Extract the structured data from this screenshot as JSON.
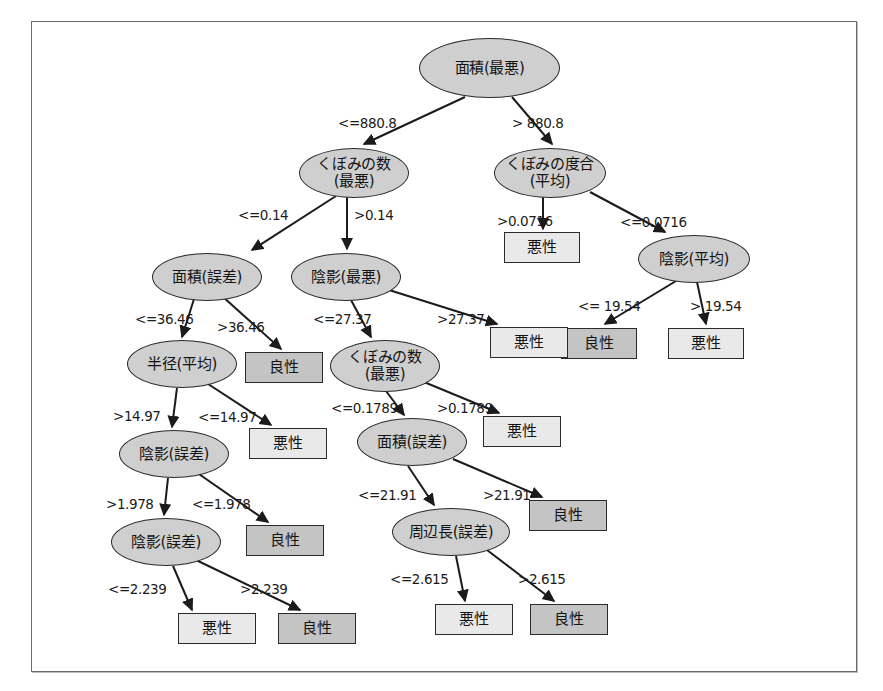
{
  "figure": {
    "type": "decision-tree-diagram",
    "title": "",
    "border_color": "#6b6b6b",
    "colors": {
      "internal_node_fill": "#cfcfcf",
      "leaf_malignant_fill": "#e9e9e9",
      "leaf_benign_fill": "#c4c4c4",
      "stroke": "#2b2b2b"
    }
  },
  "chart_data": {
    "type": "tree",
    "title": "",
    "root": "n_area_worst",
    "class_labels": {
      "malignant": "悪性",
      "benign": "良性"
    }
  },
  "nodes": [
    {
      "id": "n_area_worst",
      "kind": "internal",
      "label": "面積(最悪)",
      "x": 419,
      "y": 38,
      "w": 141,
      "h": 60
    },
    {
      "id": "n_concave_worst",
      "kind": "internal",
      "label": "くぼみの数\n(最悪)",
      "x": 299,
      "y": 148,
      "w": 110,
      "h": 50
    },
    {
      "id": "n_concavity_mean",
      "kind": "internal",
      "label": "くぼみの度合\n(平均)",
      "x": 494,
      "y": 148,
      "w": 112,
      "h": 50
    },
    {
      "id": "leaf_a",
      "kind": "leaf",
      "label": "悪性",
      "cls": "malignant",
      "x": 504,
      "y": 232,
      "w": 76,
      "h": 31
    },
    {
      "id": "n_texture_mean",
      "kind": "internal",
      "label": "陰影(平均)",
      "x": 638,
      "y": 235,
      "w": 112,
      "h": 48
    },
    {
      "id": "leaf_b",
      "kind": "leaf",
      "label": "良性",
      "cls": "benign",
      "x": 561,
      "y": 328,
      "w": 76,
      "h": 31
    },
    {
      "id": "leaf_c",
      "kind": "leaf",
      "label": "悪性",
      "cls": "malignant",
      "x": 668,
      "y": 328,
      "w": 76,
      "h": 31
    },
    {
      "id": "n_area_se",
      "kind": "internal",
      "label": "面積(誤差)",
      "x": 152,
      "y": 253,
      "w": 110,
      "h": 48
    },
    {
      "id": "n_texture_worst",
      "kind": "internal",
      "label": "陰影(最悪)",
      "x": 291,
      "y": 253,
      "w": 110,
      "h": 48
    },
    {
      "id": "leaf_d",
      "kind": "leaf",
      "label": "良性",
      "cls": "benign",
      "x": 245,
      "y": 352,
      "w": 78,
      "h": 31
    },
    {
      "id": "n_radius_mean",
      "kind": "internal",
      "label": "半径(平均)",
      "x": 127,
      "y": 340,
      "w": 110,
      "h": 48
    },
    {
      "id": "n_concave_worst_2",
      "kind": "internal",
      "label": "くぼみの数\n(最悪)",
      "x": 330,
      "y": 340,
      "w": 110,
      "h": 52
    },
    {
      "id": "leaf_e",
      "kind": "leaf",
      "label": "悪性",
      "cls": "malignant",
      "x": 490,
      "y": 327,
      "w": 78,
      "h": 31
    },
    {
      "id": "n_texture_se",
      "kind": "internal",
      "label": "陰影(誤差)",
      "x": 119,
      "y": 430,
      "w": 110,
      "h": 48
    },
    {
      "id": "leaf_f",
      "kind": "leaf",
      "label": "悪性",
      "cls": "malignant",
      "x": 249,
      "y": 428,
      "w": 78,
      "h": 31
    },
    {
      "id": "n_area_se_2",
      "kind": "internal",
      "label": "面積(誤差)",
      "x": 357,
      "y": 418,
      "w": 110,
      "h": 48
    },
    {
      "id": "leaf_g",
      "kind": "leaf",
      "label": "悪性",
      "cls": "malignant",
      "x": 483,
      "y": 416,
      "w": 78,
      "h": 31
    },
    {
      "id": "n_texture_se_2",
      "kind": "internal",
      "label": "陰影(誤差)",
      "x": 111,
      "y": 518,
      "w": 110,
      "h": 48
    },
    {
      "id": "leaf_h",
      "kind": "leaf",
      "label": "良性",
      "cls": "benign",
      "x": 246,
      "y": 525,
      "w": 78,
      "h": 31
    },
    {
      "id": "n_perimeter_se",
      "kind": "internal",
      "label": "周辺長(誤差)",
      "x": 392,
      "y": 508,
      "w": 118,
      "h": 48
    },
    {
      "id": "leaf_i",
      "kind": "leaf",
      "label": "良性",
      "cls": "benign",
      "x": 529,
      "y": 500,
      "w": 78,
      "h": 31
    },
    {
      "id": "leaf_j",
      "kind": "leaf",
      "label": "悪性",
      "cls": "malignant",
      "x": 178,
      "y": 613,
      "w": 78,
      "h": 31
    },
    {
      "id": "leaf_k",
      "kind": "leaf",
      "label": "良性",
      "cls": "benign",
      "x": 278,
      "y": 613,
      "w": 78,
      "h": 31
    },
    {
      "id": "leaf_l",
      "kind": "leaf",
      "label": "悪性",
      "cls": "malignant",
      "x": 435,
      "y": 604,
      "w": 78,
      "h": 31
    },
    {
      "id": "leaf_m",
      "kind": "leaf",
      "label": "良性",
      "cls": "benign",
      "x": 530,
      "y": 604,
      "w": 78,
      "h": 31
    }
  ],
  "edges": [
    {
      "id": "e1",
      "from": "n_area_worst",
      "to": "n_concave_worst",
      "label": "<=880.8",
      "lx": 338,
      "ly": 117,
      "x1": 465,
      "y1": 97,
      "x2": 364,
      "y2": 144
    },
    {
      "id": "e2",
      "from": "n_area_worst",
      "to": "n_concavity_mean",
      "label": "> 880.8",
      "lx": 512,
      "ly": 117,
      "x1": 512,
      "y1": 97,
      "x2": 552,
      "y2": 144
    },
    {
      "id": "e3",
      "from": "n_concave_worst",
      "to": "n_area_se",
      "label": "<=0.14",
      "lx": 238,
      "ly": 209,
      "x1": 336,
      "y1": 196,
      "x2": 252,
      "y2": 250
    },
    {
      "id": "e4",
      "from": "n_concave_worst",
      "to": "n_texture_worst",
      "label": ">0.14",
      "lx": 354,
      "ly": 209,
      "x1": 347,
      "y1": 197,
      "x2": 347,
      "y2": 249
    },
    {
      "id": "e5",
      "from": "n_concavity_mean",
      "to": "leaf_a",
      "label": ">0.0716",
      "lx": 497,
      "ly": 215,
      "x1": 543,
      "y1": 197,
      "x2": 543,
      "y2": 229
    },
    {
      "id": "e6",
      "from": "n_concavity_mean",
      "to": "n_texture_mean",
      "label": "<=0.0716",
      "lx": 620,
      "ly": 216,
      "x1": 590,
      "y1": 192,
      "x2": 665,
      "y2": 232
    },
    {
      "id": "e7",
      "from": "n_texture_mean",
      "to": "leaf_b",
      "label": "<= 19.54",
      "lx": 578,
      "ly": 300,
      "x1": 676,
      "y1": 281,
      "x2": 605,
      "y2": 324
    },
    {
      "id": "e8",
      "from": "n_texture_mean",
      "to": "leaf_c",
      "label": "> 19.54",
      "lx": 690,
      "ly": 300,
      "x1": 697,
      "y1": 282,
      "x2": 706,
      "y2": 324
    },
    {
      "id": "e9",
      "from": "n_area_se",
      "to": "n_radius_mean",
      "label": "<=36.46",
      "lx": 135,
      "ly": 313,
      "x1": 194,
      "y1": 299,
      "x2": 182,
      "y2": 337
    },
    {
      "id": "e10",
      "from": "n_area_se",
      "to": "leaf_d",
      "label": ">36.46",
      "lx": 217,
      "ly": 321,
      "x1": 222,
      "y1": 296,
      "x2": 281,
      "y2": 349
    },
    {
      "id": "e11",
      "from": "n_texture_worst",
      "to": "n_concave_worst_2",
      "label": "<=27.37",
      "lx": 313,
      "ly": 313,
      "x1": 351,
      "y1": 300,
      "x2": 371,
      "y2": 337
    },
    {
      "id": "e12",
      "from": "n_texture_worst",
      "to": "leaf_e",
      "label": ">27.37",
      "lx": 437,
      "ly": 313,
      "x1": 389,
      "y1": 290,
      "x2": 497,
      "y2": 324
    },
    {
      "id": "e13",
      "from": "n_radius_mean",
      "to": "n_texture_se",
      "label": ">14.97",
      "lx": 113,
      "ly": 410,
      "x1": 177,
      "y1": 388,
      "x2": 172,
      "y2": 427
    },
    {
      "id": "e14",
      "from": "n_radius_mean",
      "to": "leaf_f",
      "label": "<=14.97",
      "lx": 198,
      "ly": 411,
      "x1": 205,
      "y1": 382,
      "x2": 271,
      "y2": 425
    },
    {
      "id": "e15",
      "from": "n_concave_worst_2",
      "to": "n_area_se_2",
      "label": "<=0.1789",
      "lx": 331,
      "ly": 402,
      "x1": 386,
      "y1": 391,
      "x2": 404,
      "y2": 415
    },
    {
      "id": "e16",
      "from": "n_concave_worst_2",
      "to": "leaf_g",
      "label": ">0.1789",
      "lx": 437,
      "ly": 402,
      "x1": 424,
      "y1": 382,
      "x2": 499,
      "y2": 413
    },
    {
      "id": "e17",
      "from": "n_texture_se",
      "to": "n_texture_se_2",
      "label": ">1.978",
      "lx": 106,
      "ly": 498,
      "x1": 168,
      "y1": 478,
      "x2": 164,
      "y2": 515
    },
    {
      "id": "e18",
      "from": "n_texture_se",
      "to": "leaf_h",
      "label": "<=1.978",
      "lx": 192,
      "ly": 498,
      "x1": 196,
      "y1": 472,
      "x2": 268,
      "y2": 522
    },
    {
      "id": "e19",
      "from": "n_area_se_2",
      "to": "n_perimeter_se",
      "label": "<=21.91",
      "lx": 358,
      "ly": 489,
      "x1": 408,
      "y1": 466,
      "x2": 434,
      "y2": 505
    },
    {
      "id": "e20",
      "from": "n_area_se_2",
      "to": "leaf_i",
      "label": ">21.91",
      "lx": 483,
      "ly": 489,
      "x1": 453,
      "y1": 459,
      "x2": 542,
      "y2": 497
    },
    {
      "id": "e21",
      "from": "n_texture_se_2",
      "to": "leaf_j",
      "label": "<=2.239",
      "lx": 108,
      "ly": 583,
      "x1": 173,
      "y1": 566,
      "x2": 192,
      "y2": 610
    },
    {
      "id": "e22",
      "from": "n_texture_se_2",
      "to": "leaf_k",
      "label": ">2.239",
      "lx": 240,
      "ly": 583,
      "x1": 196,
      "y1": 560,
      "x2": 300,
      "y2": 610
    },
    {
      "id": "e23",
      "from": "n_perimeter_se",
      "to": "leaf_l",
      "label": "<=2.615",
      "lx": 390,
      "ly": 573,
      "x1": 456,
      "y1": 556,
      "x2": 465,
      "y2": 601
    },
    {
      "id": "e24",
      "from": "n_perimeter_se",
      "to": "leaf_m",
      "label": ">2.615",
      "lx": 518,
      "ly": 573,
      "x1": 487,
      "y1": 550,
      "x2": 554,
      "y2": 601
    }
  ]
}
